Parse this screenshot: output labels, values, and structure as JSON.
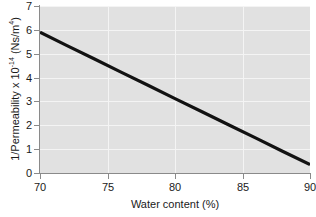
{
  "chart_data": {
    "type": "line",
    "title": "",
    "xlabel": "Water content (%)",
    "ylabel_parts": {
      "main": "1/Permeability x 10",
      "exponent": "-14",
      "units_open": " (Ns/m",
      "units_exponent": "4",
      "units_close": ")"
    },
    "ylabel_plain": "1/Permeability x 10-14 (Ns/m4)",
    "xlim": [
      70,
      90
    ],
    "ylim": [
      0,
      7
    ],
    "xticks": [
      70,
      75,
      80,
      85,
      90
    ],
    "yticks": [
      0,
      1,
      2,
      3,
      4,
      5,
      6,
      7
    ],
    "xtick_labels": [
      "70",
      "75",
      "80",
      "85",
      "90"
    ],
    "ytick_labels": [
      "0",
      "1",
      "2",
      "3",
      "4",
      "5",
      "6",
      "7"
    ],
    "grid": true,
    "grid_color": "#f4f4f4",
    "panel_color": "#e1e1e1",
    "legend": null,
    "series": [
      {
        "name": "1/Permeability vs water content",
        "color": "#121212",
        "linewidth": 3.2,
        "x": [
          70,
          72,
          74,
          76,
          78,
          80,
          82,
          84,
          86,
          88,
          90
        ],
        "values": [
          5.9,
          5.34,
          4.79,
          4.23,
          3.68,
          3.12,
          2.57,
          2.01,
          1.46,
          0.9,
          0.35
        ]
      }
    ]
  },
  "axis": {
    "x_tick_labels": [
      "70",
      "75",
      "80",
      "85",
      "90"
    ],
    "y_tick_labels": [
      "0",
      "1",
      "2",
      "3",
      "4",
      "5",
      "6",
      "7"
    ]
  }
}
